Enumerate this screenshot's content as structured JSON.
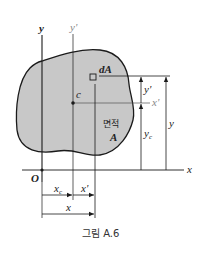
{
  "figure": {
    "caption": "그림 A.6",
    "region_label_line1": "면적",
    "region_label_line2": "A",
    "element_label": "dA",
    "centroid_label": "c",
    "origin_label": "O"
  },
  "axes": {
    "x": "x",
    "y": "y",
    "x_prime": "x'",
    "y_prime": "y'"
  },
  "dimensions": {
    "vertical": {
      "y_prime": "y'",
      "y_c": "y",
      "y_c_sub": "c",
      "y": "y"
    },
    "horizontal": {
      "x_c": "x",
      "x_c_sub": "c",
      "x_prime": "x'",
      "x": "x"
    }
  },
  "colors": {
    "region_fill": "#c8c8c8",
    "line": "#1a1a1a",
    "secondary_axis": "#888888"
  }
}
